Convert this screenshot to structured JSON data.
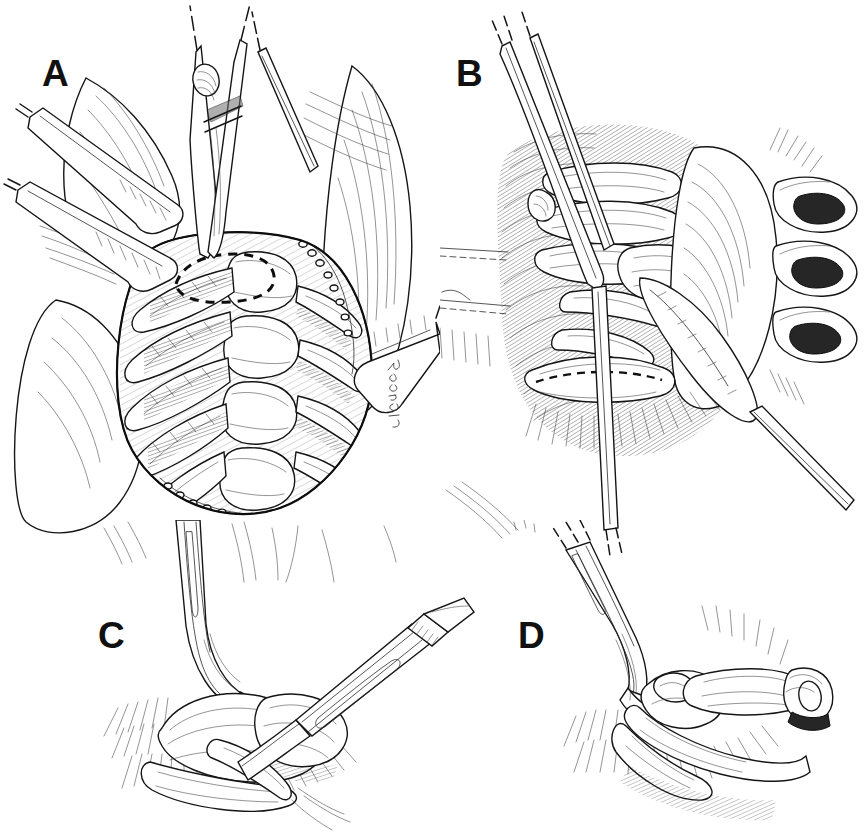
{
  "figure": {
    "medium": "pen-and-ink line drawing",
    "background_color": "#ffffff",
    "ink_color": "#1a1a1a",
    "width": 865,
    "height": 837
  },
  "panels": [
    {
      "id": "A",
      "label": "A",
      "label_x": 42,
      "label_y": 55,
      "caption": "Thoracotomy exposure of the thoracic spine with self-retaining retractors; forceps elevates pleura over the rib head, dashed line marks planned periosteal incision",
      "elements": [
        "malleable-retractor-upper-left",
        "malleable-retractor-lower-left",
        "malleable-retractor-right",
        "tissue-forceps",
        "vertebral-bodies",
        "ribs",
        "intercostal-vessels",
        "dashed-incision-outline",
        "artist-signature"
      ]
    },
    {
      "id": "B",
      "label": "B",
      "label_x": 456,
      "label_y": 55,
      "caption": "Close-up of rib head and costovertebral junction; elevator retracts segmental vessels, dashed line indicates the level of rib resection",
      "elements": [
        "dissector-probe",
        "periosteal-elevator",
        "rib-heads",
        "vertebral-body",
        "cut-rib-stumps",
        "dashed-resection-line"
      ]
    },
    {
      "id": "C",
      "label": "C",
      "label_x": 98,
      "label_y": 617,
      "caption": "Scalpel divides the costotransverse and radiate ligaments while a nerve hook retracts the rib head",
      "elements": [
        "nerve-hook-retractor",
        "scalpel",
        "rib-head",
        "transverse-process",
        "soft-tissue-hatching"
      ]
    },
    {
      "id": "D",
      "label": "D",
      "label_x": 518,
      "label_y": 617,
      "caption": "Rib head mobilized and lifted away, exposing the lateral vertebral body and disc space",
      "elements": [
        "nerve-hook-retractor",
        "mobilized-rib-head",
        "vertebral-body",
        "exposed-disc-space"
      ]
    }
  ]
}
